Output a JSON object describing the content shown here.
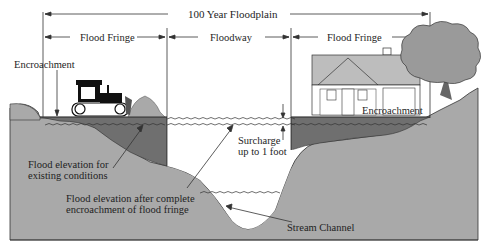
{
  "diagram": {
    "title": "100 Year Floodplain",
    "zones": [
      {
        "label": "Flood Fringe",
        "position": "left"
      },
      {
        "label": "Floodway",
        "position": "center"
      },
      {
        "label": "Flood Fringe",
        "position": "right"
      }
    ],
    "annotations": {
      "encroachment_left": "Encroachment",
      "encroachment_right": "Encroachment",
      "surcharge_line1": "Surcharge",
      "surcharge_line2": "up to 1 foot",
      "existing_line1": "Flood elevation for",
      "existing_line2": "existing conditions",
      "after_line1": "Flood elevation after complete",
      "after_line2": "encroachment of flood fringe",
      "stream_channel": "Stream Channel"
    },
    "colors": {
      "ground": "#a9a9a9",
      "encroachment_fill": "#6f6f6f",
      "water": "#ffffff",
      "lines": "#222222",
      "house_roof": "#bdbdbd",
      "tree": "#9a9a9a"
    }
  }
}
